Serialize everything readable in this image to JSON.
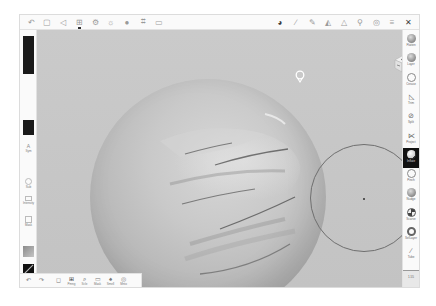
{
  "app": {
    "background_color": "#c9c9c9",
    "accent_color": "#111111"
  },
  "top_toolbar": {
    "left_icons": [
      {
        "name": "undo-arrow-icon",
        "glyph": "↶"
      },
      {
        "name": "files-icon",
        "glyph": "▢"
      },
      {
        "name": "share-icon",
        "glyph": "◁"
      },
      {
        "name": "layers-grid-icon",
        "glyph": "⊞",
        "active": true
      },
      {
        "name": "settings-icon",
        "glyph": "⚙"
      },
      {
        "name": "sun-icon",
        "glyph": "☼"
      },
      {
        "name": "sphere-icon",
        "glyph": "●"
      },
      {
        "name": "frame-icon",
        "glyph": "⌗"
      },
      {
        "name": "camera-icon",
        "glyph": "▭"
      }
    ],
    "right_icons": [
      {
        "name": "color-wheel-icon",
        "glyph": "◕",
        "dark": true
      },
      {
        "name": "brush-icon",
        "glyph": "∕"
      },
      {
        "name": "pen-icon",
        "glyph": "✎"
      },
      {
        "name": "stroke-icon",
        "glyph": "◭"
      },
      {
        "name": "falloff-icon",
        "glyph": "△"
      },
      {
        "name": "search-zoom-icon",
        "glyph": "⚲"
      },
      {
        "name": "symmetry-icon",
        "glyph": "◎"
      },
      {
        "name": "menu-icon",
        "glyph": "≡"
      },
      {
        "name": "close-x-icon",
        "glyph": "✕",
        "dark": true
      }
    ]
  },
  "left_panel": {
    "color_swatch_primary": "#1a1a1a",
    "color_swatch_secondary": "#1a1a1a",
    "items": [
      {
        "label": "Sym",
        "icon": "symmetry-a-icon",
        "glyph": "A"
      },
      {
        "label": "Sub",
        "icon": "subdivide-icon"
      },
      {
        "label": "Intensity",
        "icon": "intensity-icon"
      },
      {
        "label": "Mask",
        "icon": "mask-icon"
      }
    ]
  },
  "right_panel": {
    "tools": [
      {
        "label": "Flatten",
        "style": "filled"
      },
      {
        "label": "Layer",
        "style": "filled"
      },
      {
        "label": "Crease",
        "style": "ring"
      },
      {
        "label": "Trim",
        "style": "glyph",
        "glyph": "◺"
      },
      {
        "label": "Split",
        "style": "glyph",
        "glyph": "⊘"
      },
      {
        "label": "Project",
        "style": "glyph",
        "glyph": "⋉"
      },
      {
        "label": "Inflate",
        "style": "white",
        "active": true
      },
      {
        "label": "Pinch",
        "style": "ring"
      },
      {
        "label": "Nudge",
        "style": "filled"
      },
      {
        "label": "Scarve",
        "style": "dual"
      },
      {
        "label": "SelLayer",
        "style": "ringdark"
      },
      {
        "label": "Tube",
        "style": "glyph",
        "glyph": "∕"
      }
    ],
    "footer_label": "1.55"
  },
  "bottom_toolbar": {
    "items": [
      {
        "label": "",
        "glyph": "↶",
        "icon": "undo-icon"
      },
      {
        "label": "",
        "glyph": "↷",
        "icon": "redo-icon"
      },
      {
        "label": "",
        "glyph": "◻",
        "icon": "mask-toggle-icon"
      },
      {
        "label": "Pmng",
        "glyph": "⊞",
        "icon": "pivot-grid-icon",
        "dark": true
      },
      {
        "label": "Scle",
        "glyph": "⌕",
        "icon": "scale-search-icon",
        "dark": true
      },
      {
        "label": "Mask",
        "glyph": "▭",
        "icon": "mask-icon"
      },
      {
        "label": "Smell",
        "glyph": "♠",
        "icon": "smooth-icon"
      },
      {
        "label": "Mnto",
        "glyph": "◎",
        "icon": "mirror-icon"
      }
    ]
  },
  "viewport": {
    "object": "sculpted sphere with finger-like creases",
    "brush_radius_indicator": true
  }
}
